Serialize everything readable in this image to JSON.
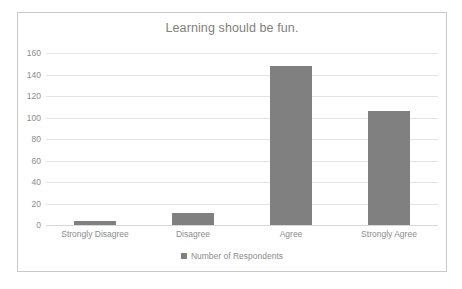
{
  "chart_data": {
    "type": "bar",
    "title": "Learning should be fun.",
    "xlabel": "",
    "ylabel": "",
    "categories": [
      "Strongly Disagree",
      "Disagree",
      "Agree",
      "Strongly Agree"
    ],
    "values": [
      4,
      11,
      148,
      106
    ],
    "series": [
      {
        "name": "Number of Respondents",
        "values": [
          4,
          11,
          148,
          106
        ]
      }
    ],
    "ylim": [
      0,
      160
    ],
    "ytick_labels": [
      "0",
      "20",
      "40",
      "60",
      "80",
      "100",
      "120",
      "140",
      "160"
    ],
    "ytick_values": [
      0,
      20,
      40,
      60,
      80,
      100,
      120,
      140,
      160
    ],
    "grid": true,
    "legend_position": "bottom",
    "legend_entries": [
      "Number of Respondents"
    ],
    "colors": {
      "bar": "#808080",
      "gridline": "#e4e4e4",
      "text": "#8c8c8c",
      "title": "#808080",
      "frame_border": "#c9c9c9",
      "background": "#ffffff"
    }
  }
}
